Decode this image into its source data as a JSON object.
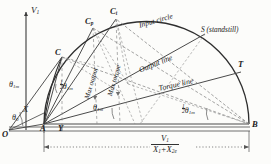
{
  "figure": {
    "type": "circle-diagram",
    "axis": {
      "vertical_label": "V",
      "vertical_label_sub": "1",
      "origin_label": "O"
    },
    "points": [
      {
        "id": "O",
        "label": "O",
        "x": 8,
        "y": 131
      },
      {
        "id": "A",
        "label": "A",
        "x": 42,
        "y": 124
      },
      {
        "id": "Y",
        "label": "Y",
        "x": 60,
        "y": 124
      },
      {
        "id": "B",
        "label": "B",
        "x": 249,
        "y": 124
      },
      {
        "id": "C",
        "label": "C",
        "x": 62,
        "y": 56
      },
      {
        "id": "Cp",
        "label": "C",
        "label_sub": "p",
        "x": 93,
        "y": 25
      },
      {
        "id": "Ct",
        "label": "C",
        "label_sub": "t",
        "x": 115,
        "y": 16
      },
      {
        "id": "S",
        "label": "S",
        "x": 202,
        "y": 31
      },
      {
        "id": "T",
        "label": "T",
        "x": 238,
        "y": 69
      }
    ],
    "annotations": {
      "input_circle": "Input circle",
      "output_line": "Output line",
      "torque_line": "Torque line",
      "max_output": "Max output",
      "max_torque": "Max torque",
      "standstill": "S (standstill)",
      "standstill_paren": "(standstill)"
    },
    "angles": [
      {
        "id": "theta-1m-left",
        "greek": "θ",
        "sub": "1m",
        "prefix": ""
      },
      {
        "id": "theta-0",
        "greek": "θ",
        "sub": "0",
        "prefix": ""
      },
      {
        "id": "half-theta-1m-a",
        "greek": "θ",
        "sub": "1m",
        "prefix": "half"
      },
      {
        "id": "theta-1m-mid",
        "greek": "θ",
        "sub": "1m",
        "prefix": ""
      },
      {
        "id": "half-theta-1m-b",
        "greek": "θ",
        "sub": "1m",
        "prefix": "half"
      }
    ],
    "labels": {
      "X": "X",
      "theta": "θ",
      "sub_1m": "1m",
      "sub_0": "0",
      "half_num": "1",
      "half_den": "2"
    },
    "dimension": {
      "numerator": "V",
      "numerator_sub": "1",
      "denominator_a": "X",
      "denominator_a_sub": "1",
      "denominator_plus": "+",
      "denominator_b": "X",
      "denominator_b_sub": "2e"
    },
    "colors": {
      "ink": "#1b1b1b",
      "line": "#3a3a3a",
      "dashed": "#6b6b6b",
      "paper": "#fcfcfa"
    }
  }
}
